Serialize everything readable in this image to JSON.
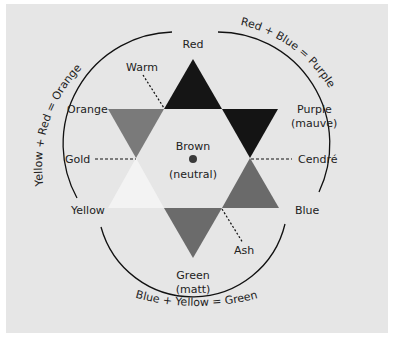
{
  "diagram": {
    "type": "color-star",
    "colors": {
      "background": "#e6e6e6",
      "red": "#151515",
      "purple": "#141414",
      "orange": "#7a7a7a",
      "blue": "#6a6a6a",
      "green": "#6b6b6b",
      "yellow": "#f3f3f3",
      "center_dot": "#3a3a3a",
      "line": "#111111"
    },
    "primary_labels": {
      "red": "Red",
      "yellow": "Yellow",
      "blue": "Blue"
    },
    "secondary_labels": {
      "orange": "Orange",
      "purple_line1": "Purple",
      "purple_line2": "(mauve)",
      "green_line1": "Green",
      "green_line2": "(matt)"
    },
    "tone_labels": {
      "warm": "Warm",
      "gold": "Gold",
      "cendre": "Cendré",
      "ash": "Ash"
    },
    "center": {
      "line1": "Brown",
      "line2": "(neutral)"
    },
    "arc_labels": {
      "yellow_red": "Yellow + Red = Orange",
      "red_blue": "Red + Blue = Purple",
      "blue_yellow": "Blue + Yellow = Green"
    }
  }
}
